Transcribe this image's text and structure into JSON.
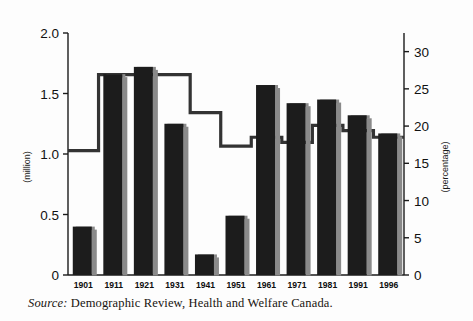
{
  "figure": {
    "background_color": "#fdfdfd",
    "source_note": {
      "label": "Source:",
      "text": "Demographic Review, Health and Welfare Canada."
    }
  },
  "chart_data": {
    "type": "bar",
    "title": "",
    "xlabel": "",
    "ylabel": "(million)",
    "y2label": "(percentage)",
    "categories": [
      "1901",
      "1911",
      "1921",
      "1931",
      "1941",
      "1951",
      "1961",
      "1971",
      "1981",
      "1991",
      "1996"
    ],
    "ylim": [
      0,
      2.0
    ],
    "y2lim": [
      0,
      32.5
    ],
    "yticks": [
      0,
      0.5,
      1.0,
      1.5,
      2.0
    ],
    "ytick_labels": [
      "0",
      "0.5",
      "1.0",
      "1.5",
      "2.0"
    ],
    "y2ticks": [
      0,
      5,
      10,
      15,
      20,
      25,
      30
    ],
    "y2tick_labels": [
      "0",
      "5",
      "10",
      "15",
      "20",
      "25",
      "30"
    ],
    "grid": false,
    "legend": "none",
    "series": [
      {
        "name": "foreign-born population",
        "type": "bar",
        "axis": "left",
        "unit": "million",
        "color": "#1c1c1c",
        "shadow_color": "#8a8a8a",
        "values": [
          0.4,
          1.66,
          1.72,
          1.25,
          0.17,
          0.49,
          1.57,
          1.42,
          1.45,
          1.32,
          1.17
        ]
      },
      {
        "name": "share of total population",
        "type": "step",
        "axis": "right",
        "unit": "percentage",
        "color": "#333333",
        "values": [
          16.7,
          26.9,
          26.9,
          26.9,
          21.8,
          17.3,
          18.5,
          17.8,
          20.1,
          19.4,
          18.5
        ]
      }
    ]
  }
}
